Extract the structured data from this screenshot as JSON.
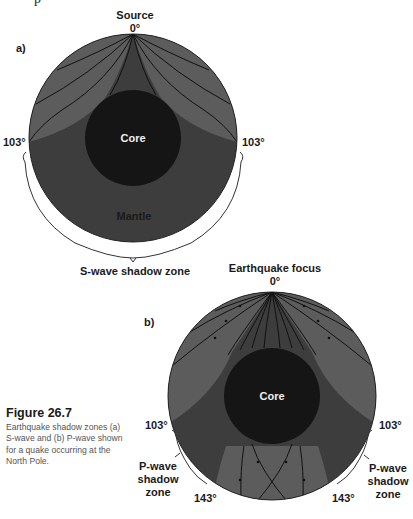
{
  "cropped_text": "p",
  "colors": {
    "mantle_receiving": "#5c5c5c",
    "shadow_zone": "#3d3d3d",
    "core": "#151515",
    "ray": "#111111",
    "text": "#1a1a1a",
    "caption_text": "#555555"
  },
  "diagram_a": {
    "panel_label": "a)",
    "source_label": "Source",
    "source_angle": "0°",
    "left_angle": "103°",
    "right_angle": "103°",
    "core_label": "Core",
    "mantle_label": "Mantle",
    "shadow_zone_label": "S-wave shadow zone"
  },
  "diagram_b": {
    "panel_label": "b)",
    "focus_label": "Earthquake focus",
    "focus_angle": "0°",
    "left_upper_angle": "103°",
    "right_upper_angle": "103°",
    "left_lower_angle": "143°",
    "right_lower_angle": "143°",
    "core_label": "Core",
    "left_shadow_label": [
      "P-wave",
      "shadow",
      "zone"
    ],
    "right_shadow_label": [
      "P-wave",
      "shadow",
      "zone"
    ]
  },
  "caption": {
    "title": "Figure 26.7",
    "text": "Earthquake shadow zones (a) S-wave and (b) P-wave shown for a quake occurring at the North Pole."
  }
}
